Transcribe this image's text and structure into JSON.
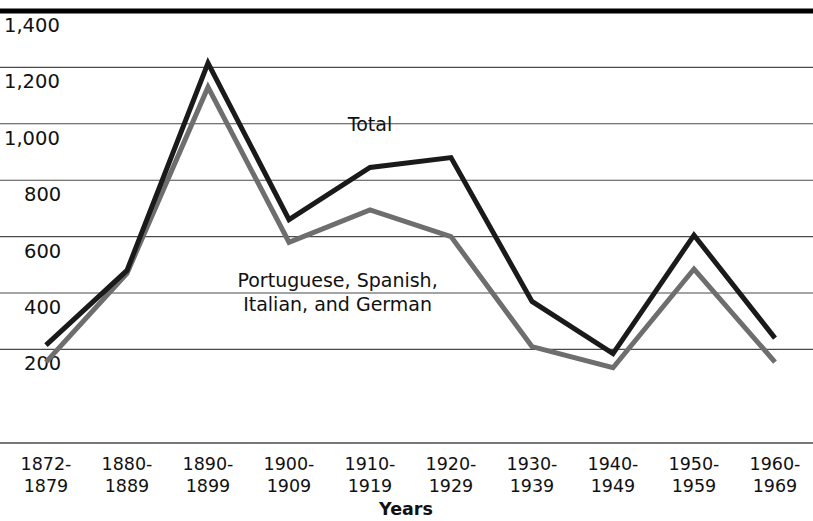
{
  "chart_data": {
    "type": "line",
    "title": "",
    "xlabel": "Years",
    "ylabel": "",
    "ylim": [
      0,
      1400
    ],
    "yticks": [
      200,
      400,
      600,
      800,
      1000,
      1200,
      1400
    ],
    "ytick_labels": [
      "200",
      "400",
      "600",
      "800",
      "1,000",
      "1,200",
      "1,400"
    ],
    "grid": true,
    "legend_position": "inline-annotation",
    "categories": [
      "1872-\n1879",
      "1880-\n1889",
      "1890-\n1899",
      "1900-\n1909",
      "1910-\n1919",
      "1920-\n1929",
      "1930-\n1939",
      "1940-\n1949",
      "1950-\n1959",
      "1960-\n1969"
    ],
    "categories_line1": [
      "1872-",
      "1880-",
      "1890-",
      "1900-",
      "1910-",
      "1920-",
      "1930-",
      "1940-",
      "1950-",
      "1960-"
    ],
    "categories_line2": [
      "1879",
      "1889",
      "1899",
      "1909",
      "1919",
      "1929",
      "1939",
      "1949",
      "1959",
      "1969"
    ],
    "series": [
      {
        "name": "Total",
        "color": "#1a1a1a",
        "width": 5,
        "values": [
          215,
          480,
          1215,
          660,
          845,
          880,
          370,
          185,
          605,
          240
        ]
      },
      {
        "name": "Portuguese, Spanish, Italian, and German",
        "color": "#6e6e6e",
        "width": 5,
        "values": [
          155,
          470,
          1130,
          580,
          695,
          600,
          210,
          135,
          485,
          155
        ]
      }
    ],
    "annotations": [
      {
        "text": "Total",
        "x_value": 4.0,
        "y_value": 975
      },
      {
        "text_line1": "Portuguese, Spanish,",
        "text_line2": "Italian, and German",
        "x_value": 3.6,
        "y_value": 420
      }
    ]
  },
  "axis": {
    "x_title": "Years"
  }
}
